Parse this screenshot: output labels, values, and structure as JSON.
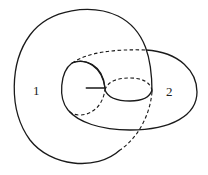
{
  "diagram": {
    "labels": [
      {
        "id": "region-1",
        "text": "1"
      },
      {
        "id": "region-2",
        "text": "2"
      }
    ],
    "line_color": "#1a1a1a"
  }
}
